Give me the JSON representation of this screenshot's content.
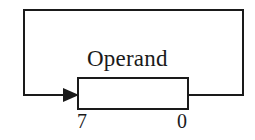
{
  "diagram": {
    "type": "block-diagram",
    "background_color": "#ffffff",
    "stroke_color": "#1a1a1a",
    "stroke_width": 2,
    "register": {
      "label": "Operand",
      "msb_label": "7",
      "lsb_label": "0",
      "box": {
        "x": 78,
        "y": 78,
        "width": 110,
        "height": 31
      }
    },
    "feedback_path": {
      "name": "feedback-loop",
      "outer_rect": {
        "x": 24,
        "y": 10,
        "right": 243,
        "bottom": 95
      },
      "arrow": {
        "direction": "right",
        "tip_x": 78,
        "y": 95,
        "style": "filled-triangle"
      }
    }
  }
}
